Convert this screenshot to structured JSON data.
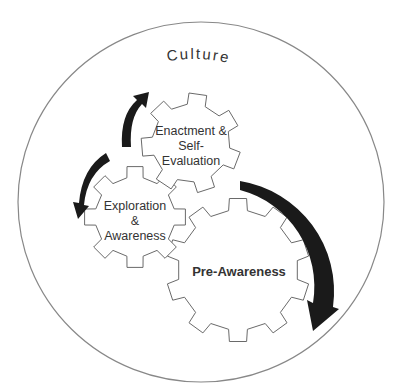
{
  "diagram": {
    "type": "concentric-gears-cycle",
    "outer_circle": {
      "label": "Culture"
    },
    "gears": [
      {
        "id": "enactment",
        "lines": [
          "Enactment &",
          "Self-",
          "Evaluation"
        ],
        "bold": false
      },
      {
        "id": "exploration",
        "lines": [
          "Exploration",
          "&",
          "Awareness"
        ],
        "bold": false
      },
      {
        "id": "pre-awareness",
        "lines": [
          "Pre-Awareness"
        ],
        "bold": true
      }
    ],
    "arrows": [
      {
        "from": "pre-awareness",
        "to": "exploration",
        "note": "large curved arrow on right side pointing down"
      },
      {
        "from": "exploration",
        "to": "enactment",
        "note": "curved arrow on left pointing up"
      },
      {
        "from": "enactment",
        "to": "exploration",
        "note": "curved arrow on left pointing down-left"
      }
    ],
    "colors": {
      "arrow": "#1a1a1a",
      "gear_stroke": "#6a6a6a",
      "circle_stroke": "#888888",
      "text": "#333333"
    }
  }
}
